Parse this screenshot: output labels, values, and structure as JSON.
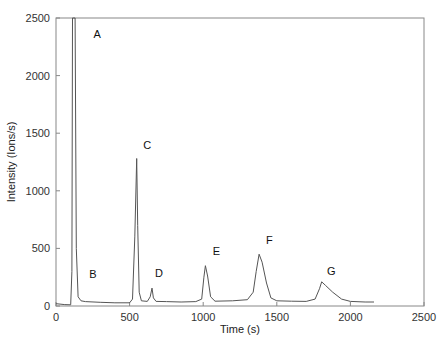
{
  "chart_data": {
    "type": "line",
    "title": "",
    "xlabel": "Time (s)",
    "ylabel": "Intensity (Ions/s)",
    "xlim": [
      0,
      2500
    ],
    "ylim": [
      0,
      2500
    ],
    "xticks": [
      0,
      500,
      1000,
      1500,
      2000,
      2500
    ],
    "yticks": [
      0,
      500,
      1000,
      1500,
      2000,
      2500
    ],
    "grid": false,
    "legend": null,
    "series": [
      {
        "name": "signal",
        "color": "#555555",
        "points": [
          [
            0,
            20
          ],
          [
            60,
            12
          ],
          [
            100,
            10
          ],
          [
            108,
            300
          ],
          [
            112,
            2600
          ],
          [
            130,
            2600
          ],
          [
            138,
            500
          ],
          [
            150,
            80
          ],
          [
            170,
            45
          ],
          [
            200,
            38
          ],
          [
            300,
            32
          ],
          [
            400,
            28
          ],
          [
            500,
            28
          ],
          [
            520,
            60
          ],
          [
            535,
            600
          ],
          [
            548,
            1280
          ],
          [
            555,
            700
          ],
          [
            565,
            120
          ],
          [
            580,
            45
          ],
          [
            620,
            40
          ],
          [
            640,
            80
          ],
          [
            652,
            155
          ],
          [
            662,
            70
          ],
          [
            680,
            40
          ],
          [
            750,
            38
          ],
          [
            850,
            35
          ],
          [
            950,
            38
          ],
          [
            990,
            60
          ],
          [
            1005,
            250
          ],
          [
            1015,
            350
          ],
          [
            1030,
            260
          ],
          [
            1050,
            80
          ],
          [
            1080,
            42
          ],
          [
            1200,
            45
          ],
          [
            1300,
            55
          ],
          [
            1340,
            120
          ],
          [
            1360,
            300
          ],
          [
            1380,
            450
          ],
          [
            1400,
            380
          ],
          [
            1430,
            200
          ],
          [
            1460,
            70
          ],
          [
            1500,
            45
          ],
          [
            1600,
            42
          ],
          [
            1700,
            40
          ],
          [
            1760,
            60
          ],
          [
            1790,
            150
          ],
          [
            1805,
            210
          ],
          [
            1830,
            180
          ],
          [
            1880,
            120
          ],
          [
            1940,
            60
          ],
          [
            2000,
            40
          ],
          [
            2100,
            35
          ],
          [
            2160,
            35
          ]
        ]
      }
    ],
    "annotations": [
      {
        "label": "A",
        "x": 280,
        "y": 2330
      },
      {
        "label": "B",
        "x": 250,
        "y": 240
      },
      {
        "label": "C",
        "x": 620,
        "y": 1360
      },
      {
        "label": "D",
        "x": 700,
        "y": 250
      },
      {
        "label": "E",
        "x": 1090,
        "y": 440
      },
      {
        "label": "F",
        "x": 1450,
        "y": 540
      },
      {
        "label": "G",
        "x": 1870,
        "y": 270
      }
    ]
  }
}
